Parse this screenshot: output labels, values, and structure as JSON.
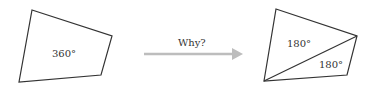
{
  "diagram": {
    "left_shape": {
      "label": "360°",
      "points": "32,10 112,36 101,75 19,82"
    },
    "arrow": {
      "label": "Why?",
      "color": "#bdbdbd"
    },
    "right_shape": {
      "points": "276,9 357,36 347,75 264,81",
      "diagonal": [
        264,
        81,
        357,
        36
      ],
      "top_triangle_label": "180°",
      "bottom_triangle_label": "180°"
    },
    "stroke_color": "#333333"
  }
}
